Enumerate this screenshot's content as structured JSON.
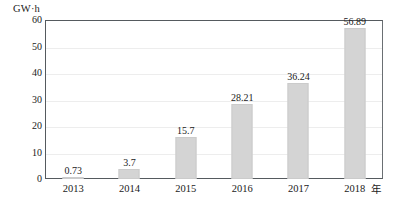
{
  "chart_data": {
    "type": "bar",
    "title": "",
    "xlabel": "年",
    "ylabel": "GW·h",
    "categories": [
      "2013",
      "2014",
      "2015",
      "2016",
      "2017",
      "2018"
    ],
    "values": [
      0.73,
      3.7,
      15.7,
      28.21,
      36.24,
      56.89
    ],
    "value_labels": [
      "0.73",
      "3.7",
      "15.7",
      "28.21",
      "36.24",
      "56.89"
    ],
    "ylim": [
      0,
      60
    ],
    "yticks": [
      0,
      10,
      20,
      30,
      40,
      50,
      60
    ],
    "ytick_labels": [
      "0",
      "10",
      "20",
      "30",
      "40",
      "50",
      "60"
    ],
    "grid": true,
    "legend": "none",
    "bar_color": "#d4d4d4",
    "axis_color": "#555a5e",
    "grid_color": "#ededed",
    "text_color": "#1a1a1a"
  }
}
